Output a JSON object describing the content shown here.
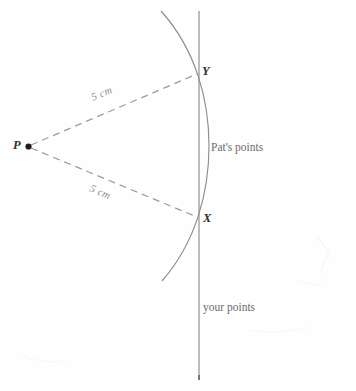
{
  "figure": {
    "title_text": "",
    "background_color": "#fefefe",
    "line_color": "#8a8a8a",
    "dash_color": "#9a9a9a",
    "point_color": "#1b1b1b",
    "text_color": "#4a4a4a"
  },
  "labels": {
    "point_p": "P",
    "point_x": "X",
    "point_y": "Y",
    "distance_upper": "5 cm",
    "distance_lower": "5 cm",
    "pats_points": "Pat's points",
    "your_points": "your points"
  },
  "geometry": {
    "point_p": {
      "x": 28,
      "y": 146
    },
    "point_y": {
      "x": 198,
      "y": 73
    },
    "point_x": {
      "x": 198,
      "y": 218
    },
    "vertical_line": {
      "x": 199,
      "y_top": 11,
      "y_bottom": 379
    },
    "arc": {
      "start_x": 161,
      "start_y": 11,
      "end_x": 162,
      "end_y": 281,
      "apex_x": 209,
      "apex_y": 146
    },
    "radius_cm": 5,
    "dash_pattern": "7 5"
  },
  "annotations": {
    "pats_points_pos": {
      "x": 211,
      "y": 142
    },
    "your_points_pos": {
      "x": 203,
      "y": 302
    },
    "upper_dim_pos": {
      "x": 92,
      "y": 93,
      "rotation_deg": -23
    },
    "lower_dim_pos": {
      "x": 90,
      "y": 183,
      "rotation_deg": 23
    }
  }
}
